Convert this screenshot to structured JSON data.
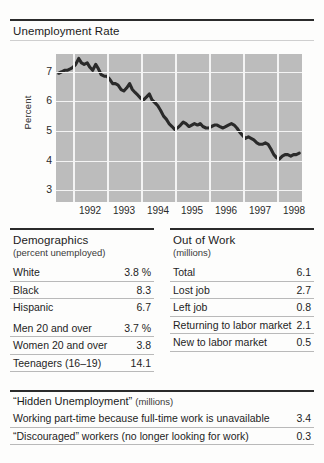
{
  "chart_panel": {
    "title": "Unemployment Rate"
  },
  "chart_data": {
    "type": "line",
    "title": "Unemployment Rate",
    "xlabel": "",
    "ylabel": "Percent",
    "ylim": [
      2.6,
      7.6
    ],
    "xlim": [
      1991.5,
      1998.75
    ],
    "grid": true,
    "legend": false,
    "ytick_labels": [
      "7",
      "6",
      "5",
      "4",
      "3"
    ],
    "ytick_values": [
      7,
      6,
      5,
      4,
      3
    ],
    "xtick_labels": [
      "1992",
      "1993",
      "1994",
      "1995",
      "1996",
      "1997",
      "1998"
    ],
    "xtick_values": [
      1992,
      1993,
      1994,
      1995,
      1996,
      1997,
      1998
    ],
    "series": [
      {
        "name": "Unemployment Rate",
        "x": [
          1991.58,
          1991.67,
          1991.75,
          1991.83,
          1991.92,
          1992.0,
          1992.08,
          1992.17,
          1992.25,
          1992.33,
          1992.42,
          1992.5,
          1992.58,
          1992.67,
          1992.75,
          1992.83,
          1992.92,
          1993.0,
          1993.08,
          1993.17,
          1993.25,
          1993.33,
          1993.42,
          1993.5,
          1993.58,
          1993.67,
          1993.75,
          1993.83,
          1993.92,
          1994.0,
          1994.08,
          1994.17,
          1994.25,
          1994.33,
          1994.42,
          1994.5,
          1994.58,
          1994.67,
          1994.75,
          1994.83,
          1994.92,
          1995.0,
          1995.08,
          1995.17,
          1995.25,
          1995.33,
          1995.42,
          1995.5,
          1995.58,
          1995.67,
          1995.75,
          1995.83,
          1995.92,
          1996.0,
          1996.08,
          1996.17,
          1996.25,
          1996.33,
          1996.42,
          1996.5,
          1996.58,
          1996.67,
          1996.75,
          1996.83,
          1996.92,
          1997.0,
          1997.08,
          1997.17,
          1997.25,
          1997.33,
          1997.42,
          1997.5,
          1997.58,
          1997.67,
          1997.75,
          1997.83,
          1997.92,
          1998.0,
          1998.08,
          1998.17,
          1998.25,
          1998.33,
          1998.42,
          1998.5,
          1998.58,
          1998.67
        ],
        "y": [
          6.95,
          7.0,
          7.05,
          7.05,
          7.1,
          7.15,
          7.25,
          7.45,
          7.3,
          7.25,
          7.3,
          7.15,
          7.05,
          7.25,
          7.1,
          6.9,
          6.85,
          6.85,
          6.75,
          6.6,
          6.6,
          6.55,
          6.4,
          6.35,
          6.45,
          6.6,
          6.4,
          6.3,
          6.2,
          6.1,
          6.05,
          6.15,
          6.25,
          6.05,
          5.95,
          5.85,
          5.7,
          5.5,
          5.4,
          5.25,
          5.15,
          5.05,
          5.1,
          5.2,
          5.3,
          5.25,
          5.15,
          5.2,
          5.25,
          5.2,
          5.25,
          5.15,
          5.1,
          5.1,
          5.15,
          5.2,
          5.2,
          5.15,
          5.1,
          5.15,
          5.2,
          5.25,
          5.2,
          5.1,
          4.95,
          4.85,
          4.75,
          4.8,
          4.75,
          4.7,
          4.6,
          4.55,
          4.55,
          4.6,
          4.55,
          4.4,
          4.2,
          4.1,
          4.05,
          4.15,
          4.2,
          4.2,
          4.15,
          4.2,
          4.2,
          4.25
        ]
      }
    ]
  },
  "demographics": {
    "title": "Demographics",
    "subtitle": "(percent unemployed)",
    "rows": [
      {
        "label": "White",
        "value": "3.8 %"
      },
      {
        "label": "Black",
        "value": "8.3"
      },
      {
        "label": "Hispanic",
        "value": "6.7"
      },
      {
        "label": "Men 20 and over",
        "value": "3.7 %"
      },
      {
        "label": "Women 20 and over",
        "value": "3.8"
      },
      {
        "label": "Teenagers (16–19)",
        "value": "14.1"
      }
    ]
  },
  "out_of_work": {
    "title": "Out of Work",
    "subtitle": "(millions)",
    "rows": [
      {
        "label": "Total",
        "value": "6.1"
      },
      {
        "label": "Lost job",
        "value": "2.7"
      },
      {
        "label": "Left job",
        "value": "0.8"
      },
      {
        "label": "Returning to labor market",
        "value": "2.1"
      },
      {
        "label": "New to labor market",
        "value": "0.5"
      }
    ]
  },
  "hidden_unemployment": {
    "title": "“Hidden Unemployment”",
    "units": "(millions)",
    "rows": [
      {
        "label": "Working part-time because full-time work is unavailable",
        "value": "3.4"
      },
      {
        "label": "“Discouraged” workers (no longer looking for work)",
        "value": "0.3"
      }
    ]
  }
}
